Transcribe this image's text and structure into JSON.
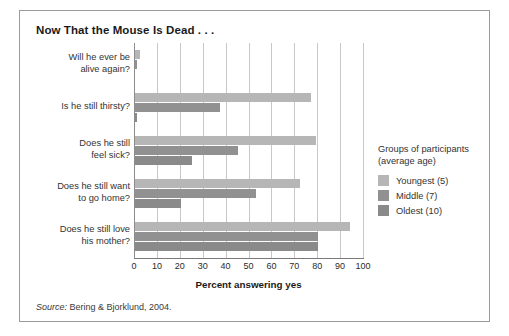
{
  "figure": {
    "title": "Now That the Mouse Is Dead . . .",
    "source_word": "Source:",
    "source_text": " Bering & Bjorklund, 2004."
  },
  "legend": {
    "title_line1": "Groups of participants",
    "title_line2": "(average age)",
    "items": [
      {
        "label": "Youngest (5)",
        "color": "#b6b6b6"
      },
      {
        "label": "Middle (7)",
        "color": "#919191"
      },
      {
        "label": "Oldest (10)",
        "color": "#8a8a8a"
      }
    ]
  },
  "chart_data": {
    "type": "bar",
    "orientation": "horizontal",
    "title": "Now That the Mouse Is Dead . . .",
    "xlabel": "Percent answering yes",
    "ylabel": "",
    "xlim": [
      0,
      100
    ],
    "xticks": [
      0,
      10,
      20,
      30,
      40,
      50,
      60,
      70,
      80,
      90,
      100
    ],
    "grid": true,
    "legend_position": "right",
    "categories": [
      "Will he ever be alive again?",
      "Is he still thirsty?",
      "Does he still feel sick?",
      "Does he still want to go home?",
      "Does he still love his mother?"
    ],
    "category_lines": [
      [
        "Will he ever be",
        "alive again?"
      ],
      [
        "Is he still thirsty?"
      ],
      [
        "Does he still",
        "feel sick?"
      ],
      [
        "Does he still want",
        "to go home?"
      ],
      [
        "Does he still love",
        "his mother?"
      ]
    ],
    "series": [
      {
        "name": "Youngest (5)",
        "color": "#b6b6b6",
        "values": [
          2,
          77,
          79,
          72,
          94
        ]
      },
      {
        "name": "Middle (7)",
        "color": "#919191",
        "values": [
          1,
          37,
          45,
          53,
          80
        ]
      },
      {
        "name": "Oldest (10)",
        "color": "#8a8a8a",
        "values": [
          0,
          1,
          25,
          20,
          80
        ]
      }
    ]
  }
}
